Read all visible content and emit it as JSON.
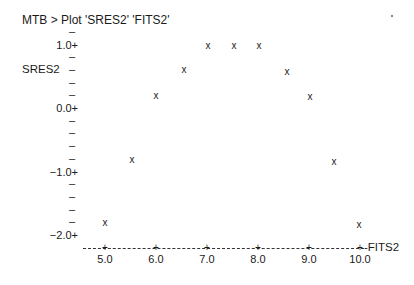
{
  "title": "MTB > Plot 'SRES2' 'FITS2'",
  "chart_data": {
    "type": "scatter",
    "title": "MTB > Plot 'SRES2' 'FITS2'",
    "xlabel": "FITS2",
    "ylabel": "SRES2",
    "marker": "x",
    "xlim": [
      4.6,
      10.1
    ],
    "ylim": [
      -2.2,
      1.2
    ],
    "x_ticks": [
      5.0,
      6.0,
      7.0,
      8.0,
      9.0,
      10.0
    ],
    "x_tick_labels": [
      "5.0",
      "6.0",
      "7.0",
      "8.0",
      "9.0",
      "10.0"
    ],
    "y_ticks": [
      1.0,
      0.0,
      -1.0,
      -2.0
    ],
    "y_tick_labels": [
      "1.0+",
      "0.0+",
      "−1.0+",
      "−2.0+"
    ],
    "y_minor_step": 0.2,
    "grid": false,
    "legend": null,
    "series": [
      {
        "name": "SRES2 vs FITS2",
        "x": [
          5.0,
          5.53,
          6.0,
          6.55,
          7.02,
          7.53,
          8.02,
          8.57,
          9.02,
          9.49,
          9.98
        ],
        "y": [
          -1.83,
          -0.83,
          0.17,
          0.58,
          0.96,
          0.96,
          0.96,
          0.55,
          0.16,
          -0.87,
          -1.86
        ]
      }
    ]
  },
  "axes": {
    "ylabel": "SRES2",
    "xlabel": "-FITS2",
    "marker_glyph": "x",
    "tick_plus": "+",
    "tick_dash": "–"
  }
}
